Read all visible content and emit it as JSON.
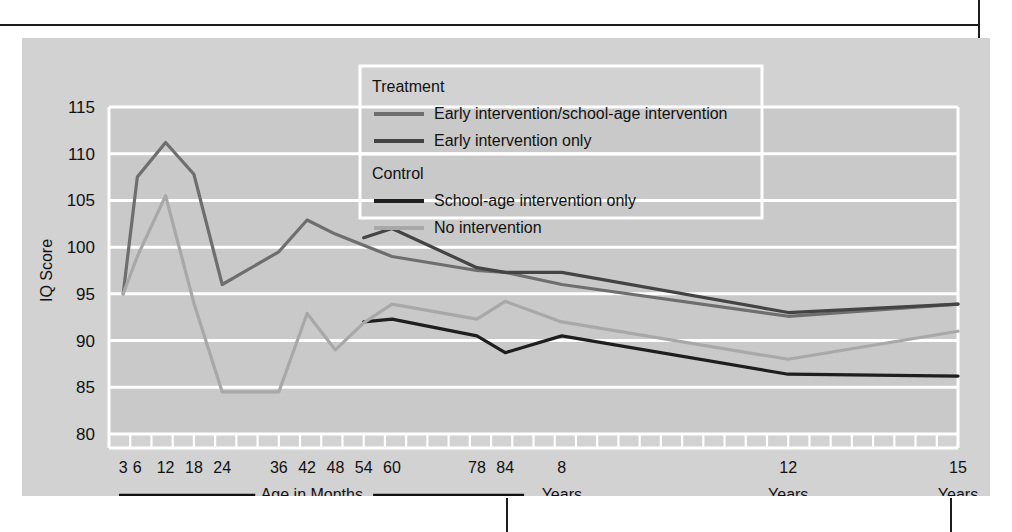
{
  "figure": {
    "background": "#d2d2d2",
    "plot_background": "#c9c9c9",
    "gridline_color": "#ffffff"
  },
  "axis_footer": {
    "months_label": "Age in Months",
    "years_groups": [
      {
        "value": "8",
        "unit": "Years"
      },
      {
        "value": "12",
        "unit": "Years"
      },
      {
        "value": "15",
        "unit": "Years"
      }
    ]
  },
  "legend": {
    "group1_title": "Treatment",
    "group2_title": "Control",
    "entries": [
      {
        "label": "Early intervention/school-age intervention",
        "color": "#6e6e6e",
        "group": "Treatment"
      },
      {
        "label": "Early intervention only",
        "color": "#444444",
        "group": "Treatment"
      },
      {
        "label": "School-age intervention only",
        "color": "#1e1e1e",
        "group": "Control"
      },
      {
        "label": "No intervention",
        "color": "#a8a8a8",
        "group": "Control"
      }
    ]
  },
  "chart_data": {
    "type": "line",
    "title": "",
    "xlabel": "Age in Months",
    "ylabel": "IQ Score",
    "ylim": [
      80,
      115
    ],
    "yticks": [
      80,
      85,
      90,
      95,
      100,
      105,
      110,
      115
    ],
    "grid": true,
    "legend_position": "top-center",
    "x_unit": "months",
    "xlim": [
      0,
      180
    ],
    "xtick_labels": [
      {
        "x": 3,
        "label": "3"
      },
      {
        "x": 6,
        "label": "6"
      },
      {
        "x": 12,
        "label": "12"
      },
      {
        "x": 18,
        "label": "18"
      },
      {
        "x": 24,
        "label": "24"
      },
      {
        "x": 36,
        "label": "36"
      },
      {
        "x": 42,
        "label": "42"
      },
      {
        "x": 48,
        "label": "48"
      },
      {
        "x": 54,
        "label": "54"
      },
      {
        "x": 60,
        "label": "60"
      },
      {
        "x": 78,
        "label": "78"
      },
      {
        "x": 84,
        "label": "84"
      },
      {
        "x": 96,
        "label": "8"
      },
      {
        "x": 144,
        "label": "12"
      },
      {
        "x": 180,
        "label": "15"
      }
    ],
    "minor_tick_step": 4.5,
    "series": [
      {
        "name": "Early intervention/school-age intervention",
        "color": "#6e6e6e",
        "width": 3.2,
        "x": [
          3,
          6,
          12,
          18,
          24,
          36,
          42,
          48,
          54,
          60,
          78,
          84,
          96,
          144,
          180
        ],
        "y": [
          95.0,
          107.5,
          111.2,
          107.8,
          96.0,
          99.5,
          102.9,
          101.4,
          100.2,
          99.0,
          97.5,
          97.3,
          96.0,
          92.6,
          93.9
        ]
      },
      {
        "name": "Early intervention only",
        "color": "#444444",
        "width": 3.2,
        "x": [
          54,
          60,
          78,
          84,
          96,
          144,
          180
        ],
        "y": [
          101.0,
          102.0,
          97.8,
          97.3,
          97.3,
          93.0,
          93.9
        ]
      },
      {
        "name": "School-age intervention only",
        "color": "#1e1e1e",
        "width": 3.2,
        "x": [
          54,
          60,
          78,
          84,
          96,
          144,
          180
        ],
        "y": [
          92.0,
          92.3,
          90.5,
          88.7,
          90.5,
          86.4,
          86.2
        ]
      },
      {
        "name": "No intervention",
        "color": "#a8a8a8",
        "width": 3.2,
        "x": [
          3,
          6,
          12,
          18,
          24,
          36,
          42,
          48,
          54,
          60,
          78,
          84,
          96,
          144,
          180
        ],
        "y": [
          95.0,
          99.0,
          105.5,
          94.0,
          84.5,
          84.5,
          92.9,
          89.0,
          91.9,
          93.9,
          92.3,
          94.2,
          92.0,
          88.0,
          91.0
        ]
      }
    ]
  }
}
